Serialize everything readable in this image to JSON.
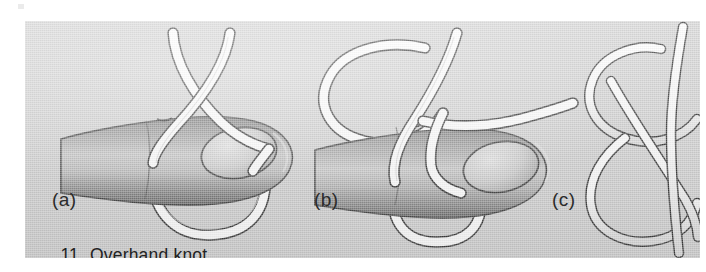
{
  "figure": {
    "number": "11",
    "caption": "Overhand knot",
    "kind": "instructional-illustration",
    "medium": "scanned-halftone-plate",
    "plate_color": "#d2d2d2",
    "rope_color": "#ffffff",
    "rope_outline_color": "#3a3a3a",
    "ink_color": "#2b2b2b",
    "skin_light": "#e2e2e2",
    "skin_mid": "#a8a8a8",
    "skin_dark": "#6f6f6f"
  },
  "panels": [
    {
      "id": "a",
      "label": "(a)",
      "subject": "finger-with-crossed-rope",
      "description": "Rope crossed over itself above a finger, forming a loop that hangs below"
    },
    {
      "id": "b",
      "label": "(b)",
      "subject": "finger-with-rope-loop",
      "description": "Rope loop brought up and over, end passing across the finger"
    },
    {
      "id": "c",
      "label": "(c)",
      "subject": "completed-overhand-knot",
      "description": "The finished overhand knot drawn without the hand, cropped at the right edge"
    }
  ]
}
